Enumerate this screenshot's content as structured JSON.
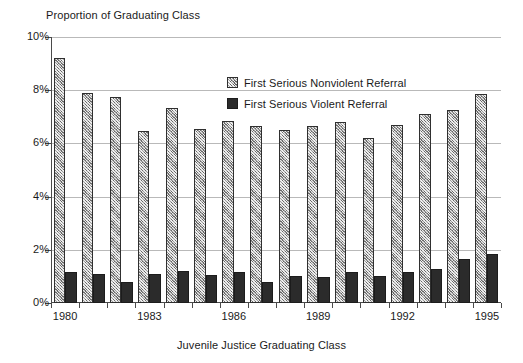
{
  "chart_data": {
    "type": "bar",
    "title": "",
    "xlabel": "Juvenile Justice Graduating Class",
    "ylabel": "Proportion of Graduating Class",
    "ylim": [
      0,
      10
    ],
    "y_tick_labels": [
      "0%",
      "2%",
      "4%",
      "6%",
      "8%",
      "10%"
    ],
    "y_tick_values": [
      0,
      2,
      4,
      6,
      8,
      10
    ],
    "grid": true,
    "legend_position": "inside-top-center",
    "categories": [
      "1980",
      "1981",
      "1982",
      "1983",
      "1984",
      "1985",
      "1986",
      "1987",
      "1988",
      "1989",
      "1990",
      "1991",
      "1992",
      "1993",
      "1994",
      "1995"
    ],
    "x_tick_labels": [
      "1980",
      "1983",
      "1986",
      "1989",
      "1992",
      "1995"
    ],
    "x_tick_categories": [
      "1980",
      "1983",
      "1986",
      "1989",
      "1992",
      "1995"
    ],
    "series": [
      {
        "name": "First Serious Nonviolent Referral",
        "color": "#9e9e9e",
        "pattern": "crosshatch",
        "values": [
          9.2,
          7.9,
          7.75,
          6.45,
          7.35,
          6.55,
          6.85,
          6.65,
          6.5,
          6.65,
          6.8,
          6.2,
          6.7,
          7.1,
          7.25,
          7.85
        ]
      },
      {
        "name": "First Serious Violent Referral",
        "color": "#2b2b2b",
        "pattern": "solid",
        "values": [
          1.15,
          1.1,
          0.8,
          1.1,
          1.2,
          1.05,
          1.15,
          0.8,
          1.0,
          0.98,
          1.18,
          1.02,
          1.18,
          1.28,
          1.65,
          1.85
        ]
      }
    ]
  },
  "legend": {
    "items": [
      {
        "label": "First Serious Nonviolent Referral",
        "swatch": "nonviolent"
      },
      {
        "label": "First Serious Violent Referral",
        "swatch": "violent"
      }
    ]
  }
}
